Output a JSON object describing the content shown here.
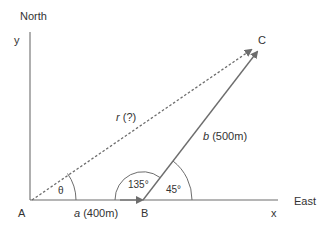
{
  "diagram": {
    "type": "vector addition",
    "axes": {
      "north_label": "North",
      "east_label": "East",
      "y_label": "y",
      "x_label": "x"
    },
    "points": {
      "A": "A",
      "B": "B",
      "C": "C"
    },
    "vectors": {
      "a": {
        "symbol": "a",
        "label": "a (400m)",
        "value": "400m",
        "from": "A",
        "to": "B",
        "style": "solid"
      },
      "b": {
        "symbol": "b",
        "label": "b (500m)",
        "value": "500m",
        "from": "B",
        "to": "C",
        "style": "solid"
      },
      "r": {
        "symbol": "r",
        "label": "r (?)",
        "value": "?",
        "from": "A",
        "to": "C",
        "style": "dashed"
      }
    },
    "angles": {
      "theta": "θ",
      "interior_B": "135°",
      "exterior_B": "45°"
    },
    "colors": {
      "line": "#6d6d6d",
      "text": "#333333"
    }
  }
}
